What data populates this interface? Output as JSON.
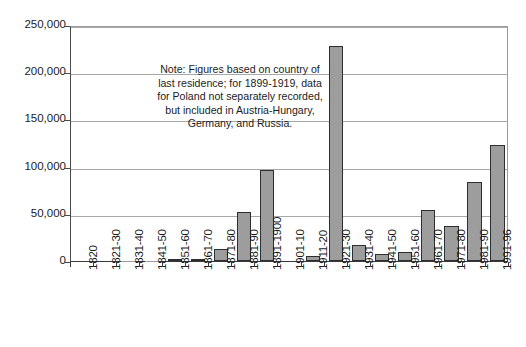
{
  "chart_data": {
    "type": "bar",
    "title": "",
    "xlabel": "",
    "ylabel": "",
    "ylim": [
      0,
      250000
    ],
    "ytick_interval": 50000,
    "grid": true,
    "legend": false,
    "categories": [
      "1820",
      "1821-30",
      "1831-40",
      "1841-50",
      "1851-60",
      "1861-70",
      "1871-80",
      "1881-90",
      "1891-1900",
      "1901-10",
      "1911-20",
      "1921-30",
      "1931-40",
      "1941-50",
      "1951-60",
      "1961-70",
      "1971-80",
      "1981-90",
      "1991-96"
    ],
    "values": [
      5,
      16,
      369,
      105,
      1164,
      1027,
      12970,
      51806,
      96720,
      0,
      4813,
      227734,
      17026,
      7571,
      9985,
      53539,
      37234,
      83252,
      122994
    ],
    "ytick_labels": [
      "0",
      "50,000",
      "100,000",
      "150,000",
      "200,000",
      "250,000"
    ],
    "ytick_values": [
      0,
      50000,
      100000,
      150000,
      200000,
      250000
    ],
    "bar_fill_color": "#9d9d9d",
    "bar_border_color": "#2e2e2e",
    "gridline_color": "#a9a9a9",
    "annotations": [
      {
        "name": "figures-note",
        "lines": [
          "Note: Figures based on country of",
          "last residence; for 1899-1919, data",
          "for Poland not separately recorded,",
          "but included in Austria-Hungary,",
          "Germany, and Russia."
        ]
      }
    ]
  }
}
